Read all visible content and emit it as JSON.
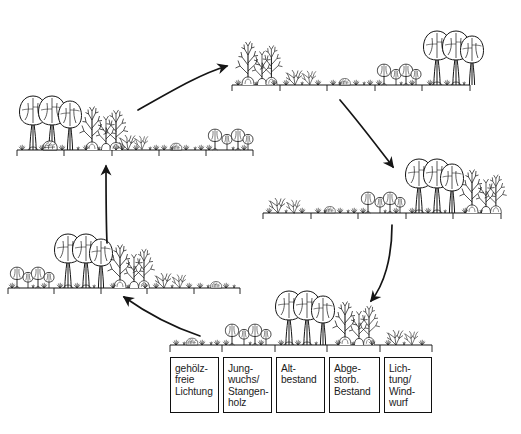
{
  "figure": {
    "kind": "forest-development-cycle-diagram",
    "cycle_direction": "clockwise",
    "background_color": "#ffffff",
    "ink_color": "#1a1a1a"
  },
  "legend": {
    "name": "phase-legend",
    "boxes": [
      {
        "label": "gehölz-\nfreie\nLichtung"
      },
      {
        "label": "Jung-\nwuchs/\nStangen-\nholz"
      },
      {
        "label": "Alt-\nbestand"
      },
      {
        "label": "Abge-\nstorb.\nBestand"
      },
      {
        "label": "Lich-\ntung/\nWind-\nwurf"
      }
    ]
  },
  "vignettes": [
    {
      "id": "bottom-center",
      "name": "vignette-reference-sequence",
      "phases": [
        "gehölzfreie Lichtung",
        "Jungwuchs/Stangenholz",
        "Altbestand",
        "Abgestorb. Bestand",
        "Lichtung/Windwurf"
      ]
    },
    {
      "id": "left-middle",
      "name": "vignette-left-middle",
      "phases": [
        "Jungwuchs/Stangenholz",
        "Altbestand",
        "Abgestorb. Bestand",
        "Lichtung/Windwurf",
        "gehölzfreie Lichtung"
      ]
    },
    {
      "id": "upper-left",
      "name": "vignette-upper-left",
      "phases": [
        "Altbestand",
        "Abgestorb. Bestand",
        "Lichtung/Windwurf",
        "gehölzfreie Lichtung",
        "Jungwuchs/Stangenholz"
      ]
    },
    {
      "id": "top-center",
      "name": "vignette-top-center",
      "phases": [
        "Abgestorb. Bestand",
        "Lichtung/Windwurf",
        "gehölzfreie Lichtung",
        "Jungwuchs/Stangenholz",
        "Altbestand"
      ]
    },
    {
      "id": "right-middle",
      "name": "vignette-right-middle",
      "phases": [
        "Lichtung/Windwurf",
        "gehölzfreie Lichtung",
        "Jungwuchs/Stangenholz",
        "Altbestand",
        "Abgestorb. Bestand"
      ]
    }
  ],
  "arrows": [
    {
      "name": "arrow-upperleft-to-topcenter",
      "from": "upper-left",
      "to": "top-center"
    },
    {
      "name": "arrow-topcenter-to-rightmiddle",
      "from": "top-center",
      "to": "right-middle"
    },
    {
      "name": "arrow-rightmiddle-to-bottomcenter",
      "from": "right-middle",
      "to": "bottom-center"
    },
    {
      "name": "arrow-bottomcenter-to-leftmiddle",
      "from": "bottom-center",
      "to": "left-middle"
    },
    {
      "name": "arrow-leftmiddle-to-upperleft",
      "from": "left-middle",
      "to": "upper-left"
    }
  ]
}
